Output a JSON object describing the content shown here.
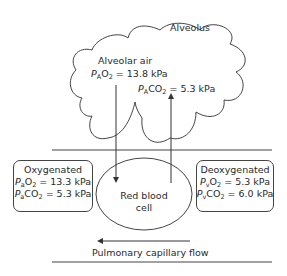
{
  "alveolus": {
    "label": "Alveolus",
    "air_label": "Alveolar air",
    "pao2": {
      "symbol": "P",
      "sub1": "A",
      "gas": "O",
      "gas_sub": "2",
      "value": " = 13.8 kPa"
    },
    "paco2": {
      "symbol": "P",
      "sub1": "A",
      "gas": "CO",
      "gas_sub": "2",
      "value": " = 5.3 kPa"
    }
  },
  "oxygenated": {
    "title": "Oxygenated",
    "o2": {
      "symbol": "P",
      "sub1": "a",
      "gas": "O",
      "gas_sub": "2",
      "value": " = 13.3 kPa"
    },
    "co2": {
      "symbol": "P",
      "sub1": "a",
      "gas": "CO",
      "gas_sub": "2",
      "value": " = 5.3 kPa"
    }
  },
  "deoxygenated": {
    "title": "Deoxygenated",
    "o2": {
      "symbol": "P",
      "sub1": "v",
      "gas": "O",
      "gas_sub": "2",
      "value": " = 5.3 kPa"
    },
    "co2": {
      "symbol": "P",
      "sub1": "v",
      "gas": "CO",
      "gas_sub": "2",
      "value": " = 6.0 kPa"
    }
  },
  "rbc": {
    "line1": "Red blood",
    "line2": "cell"
  },
  "flow": {
    "label": "Pulmonary capillary flow",
    "direction": "left"
  },
  "colors": {
    "line": "#444444",
    "text": "#2a2a2a"
  }
}
